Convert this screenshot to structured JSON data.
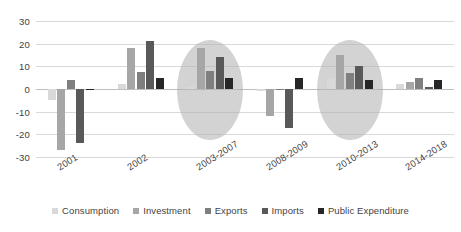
{
  "chart_data": {
    "type": "bar",
    "title": "",
    "subtitle": "",
    "xlabel": "",
    "ylabel": "",
    "ylim": [
      -30,
      30
    ],
    "yticks": [
      30,
      20,
      10,
      0,
      -10,
      -20,
      -30
    ],
    "grid": true,
    "legend_position": "bottom",
    "categories": [
      "2001",
      "2002",
      "2003-2007",
      "2008-2009",
      "2010-2013",
      "2014-2018"
    ],
    "series": [
      {
        "name": "Consumption",
        "color": "#d9d9d9",
        "values": [
          -5,
          2,
          1,
          -1,
          5,
          2
        ]
      },
      {
        "name": "Investment",
        "color": "#a6a6a6",
        "values": [
          -27,
          18,
          18,
          -12,
          15,
          3
        ]
      },
      {
        "name": "Exports",
        "color": "#7f7f7f",
        "values": [
          4,
          7.5,
          8,
          0,
          7,
          5
        ]
      },
      {
        "name": "Imports",
        "color": "#595959",
        "values": [
          -24,
          21,
          14,
          -17,
          10,
          1
        ]
      },
      {
        "name": "Public Expenditure",
        "color": "#262626",
        "values": [
          0,
          5,
          5,
          5,
          4,
          4
        ]
      }
    ],
    "annotations": [
      {
        "type": "ellipse",
        "label": "highlight-2003-2007",
        "category": "2003-2007",
        "color": "#b3b3b3"
      },
      {
        "type": "ellipse",
        "label": "highlight-2010-2013",
        "category": "2010-2013",
        "color": "#b3b3b3"
      }
    ]
  },
  "legend": {
    "items": [
      {
        "label": "Consumption"
      },
      {
        "label": "Investment"
      },
      {
        "label": "Exports"
      },
      {
        "label": "Imports"
      },
      {
        "label": "Public Expenditure"
      }
    ]
  }
}
